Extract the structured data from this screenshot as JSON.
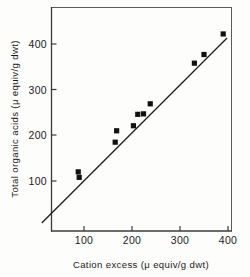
{
  "chart_data": {
    "type": "scatter",
    "title": "",
    "xlabel": "Cation excess (μ equiv/g dwt)",
    "ylabel": "Total organic acids (μ equiv/g dwt)",
    "xlim": [
      0,
      420
    ],
    "ylim": [
      0,
      450
    ],
    "xticks": [
      100,
      200,
      300,
      400
    ],
    "xtick_labels": [
      "100",
      "200",
      "300",
      "400"
    ],
    "yticks": [
      100,
      200,
      300,
      400
    ],
    "ytick_labels": [
      "100",
      "200",
      "300",
      "400"
    ],
    "grid": false,
    "legend": null,
    "marker_style": "filled-square",
    "marker_color": "#111111",
    "points": [
      {
        "x": 88,
        "y": 120
      },
      {
        "x": 90,
        "y": 108
      },
      {
        "x": 165,
        "y": 185
      },
      {
        "x": 168,
        "y": 210
      },
      {
        "x": 203,
        "y": 221
      },
      {
        "x": 212,
        "y": 246
      },
      {
        "x": 224,
        "y": 247
      },
      {
        "x": 238,
        "y": 269
      },
      {
        "x": 330,
        "y": 358
      },
      {
        "x": 350,
        "y": 377
      },
      {
        "x": 390,
        "y": 422
      }
    ],
    "fit_line": {
      "label": "regression line",
      "x_start": 12,
      "y_start": 8,
      "x_end": 398,
      "y_end": 413
    }
  },
  "axes": {
    "x_axis_name": "cation-excess-axis",
    "y_axis_name": "total-organic-acids-axis"
  }
}
